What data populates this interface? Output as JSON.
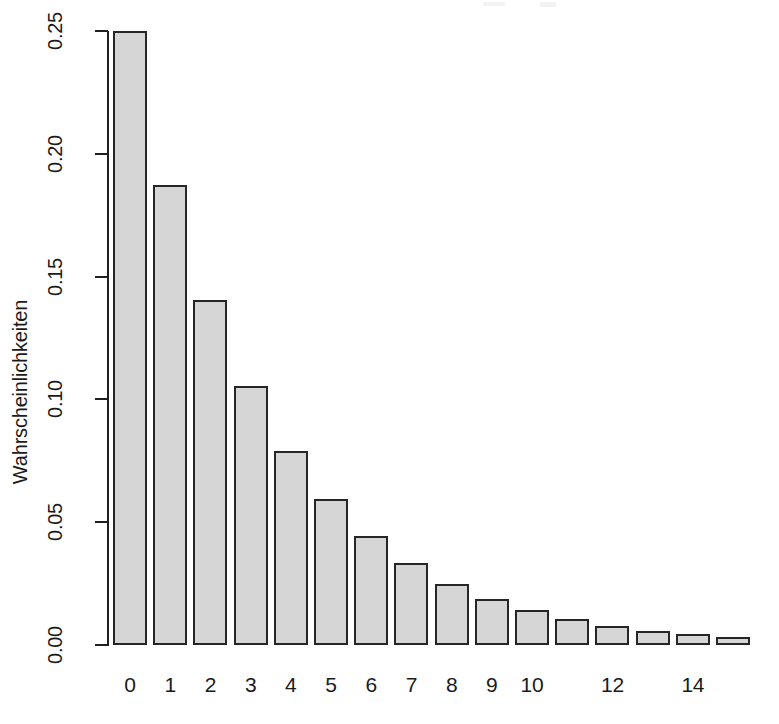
{
  "chart_data": {
    "type": "bar",
    "title": "",
    "subtitle": "",
    "xlabel": "",
    "ylabel": "Wahrscheinlichkeiten",
    "categories": [
      "0",
      "1",
      "2",
      "3",
      "4",
      "5",
      "6",
      "7",
      "8",
      "9",
      "10",
      "11",
      "12",
      "13",
      "14",
      "15"
    ],
    "values": [
      0.25,
      0.1875,
      0.1406,
      0.1055,
      0.0791,
      0.0593,
      0.0445,
      0.0334,
      0.025,
      0.0188,
      0.0141,
      0.0106,
      0.0079,
      0.0059,
      0.0045,
      0.0033
    ],
    "x_tick_labels": [
      "0",
      "1",
      "2",
      "3",
      "4",
      "5",
      "6",
      "7",
      "8",
      "9",
      "10",
      "",
      "12",
      "",
      "14",
      ""
    ],
    "y_tick_labels": [
      "0.00",
      "0.05",
      "0.10",
      "0.15",
      "0.20",
      "0.25"
    ],
    "y_tick_values": [
      0.0,
      0.05,
      0.1,
      0.15,
      0.2,
      0.25
    ],
    "ylim": [
      0,
      0.25
    ],
    "xlim_categories": 16,
    "grid": false,
    "legend": null,
    "bar_fill_color": "#d6d6d6",
    "bar_border_color": "#262626",
    "background_color": "#ffffff",
    "axis_color": "#1f1f1f"
  }
}
